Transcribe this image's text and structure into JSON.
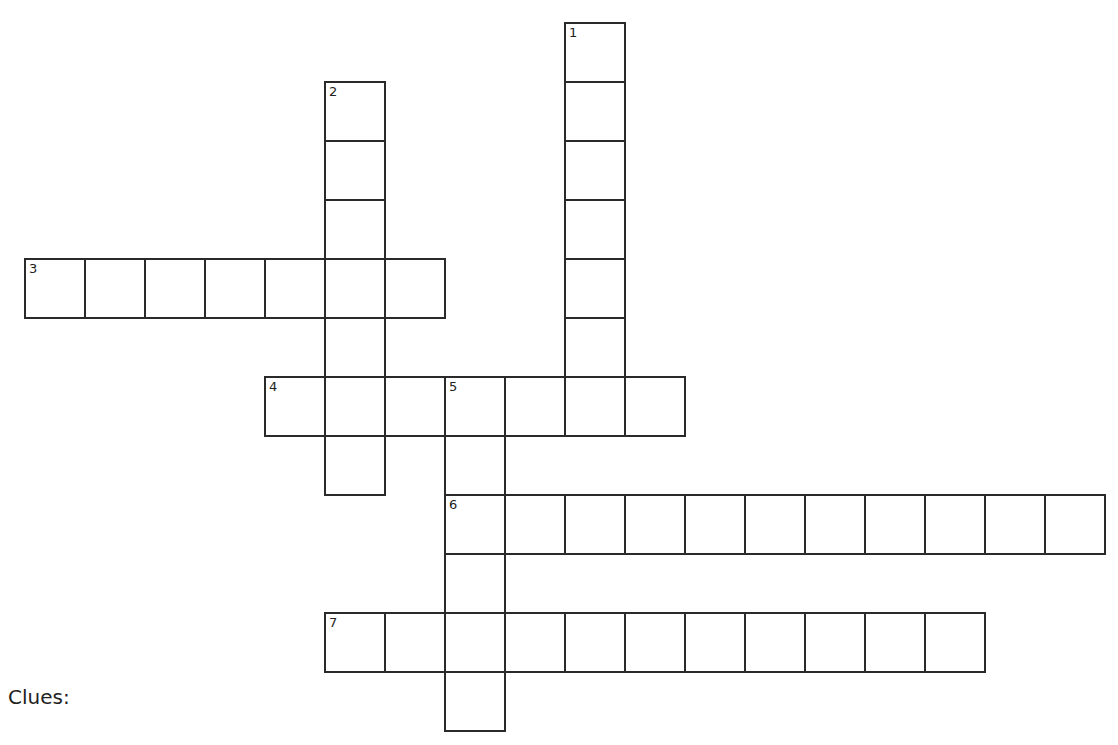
{
  "puzzle": {
    "cell_width": 60,
    "cell_height": 59,
    "origin_x": 25,
    "origin_y": 23,
    "words": [
      {
        "number": "1",
        "direction": "down",
        "row": 0,
        "col": 9,
        "length": 7
      },
      {
        "number": "2",
        "direction": "down",
        "row": 1,
        "col": 5,
        "length": 7
      },
      {
        "number": "3",
        "direction": "across",
        "row": 4,
        "col": 0,
        "length": 7
      },
      {
        "number": "4",
        "direction": "across",
        "row": 6,
        "col": 4,
        "length": 7
      },
      {
        "number": "5",
        "direction": "down",
        "row": 6,
        "col": 7,
        "length": 6
      },
      {
        "number": "6",
        "direction": "across",
        "row": 8,
        "col": 7,
        "length": 11
      },
      {
        "number": "7",
        "direction": "across",
        "row": 10,
        "col": 5,
        "length": 11
      }
    ]
  },
  "clues": {
    "label": "Clues:"
  }
}
